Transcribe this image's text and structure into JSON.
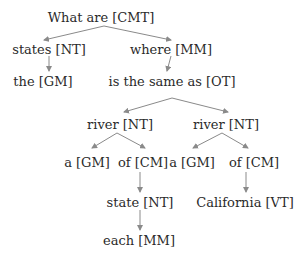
{
  "diagram": {
    "type": "dependency-tree",
    "edge_color": "#8a8a8a",
    "text_color": "#2a2a2a",
    "nodes": [
      {
        "id": "n0",
        "label": "What are [CMT]",
        "x": 101,
        "y": 17
      },
      {
        "id": "n1",
        "label": "states [NT]",
        "x": 49,
        "y": 49
      },
      {
        "id": "n2",
        "label": "where [MM]",
        "x": 171,
        "y": 49
      },
      {
        "id": "n3",
        "label": "the [GM]",
        "x": 43,
        "y": 81
      },
      {
        "id": "n4",
        "label": "is the same as [OT]",
        "x": 172,
        "y": 81
      },
      {
        "id": "n5",
        "label": "river [NT]",
        "x": 120,
        "y": 124
      },
      {
        "id": "n6",
        "label": "river [NT]",
        "x": 226,
        "y": 124
      },
      {
        "id": "n7",
        "label": "a [GM]",
        "x": 87,
        "y": 162
      },
      {
        "id": "n8",
        "label": "of [CM]",
        "x": 143,
        "y": 162
      },
      {
        "id": "n9",
        "label": "a [GM]",
        "x": 192,
        "y": 162
      },
      {
        "id": "n10",
        "label": "of [CM]",
        "x": 254,
        "y": 162
      },
      {
        "id": "n11",
        "label": "state [NT]",
        "x": 140,
        "y": 202
      },
      {
        "id": "n12",
        "label": "California [VT]",
        "x": 245,
        "y": 202
      },
      {
        "id": "n13",
        "label": "each [MM]",
        "x": 139,
        "y": 240
      }
    ],
    "edges": [
      {
        "from": "n0",
        "to": "n1",
        "x1": 104,
        "y1": 26,
        "x2": 44,
        "y2": 40
      },
      {
        "from": "n0",
        "to": "n2",
        "x1": 104,
        "y1": 26,
        "x2": 171,
        "y2": 40
      },
      {
        "from": "n1",
        "to": "n3",
        "x1": 49,
        "y1": 56,
        "x2": 49,
        "y2": 71
      },
      {
        "from": "n2",
        "to": "n4",
        "x1": 171,
        "y1": 56,
        "x2": 167,
        "y2": 71
      },
      {
        "from": "n4",
        "to": "n5",
        "x1": 172,
        "y1": 98,
        "x2": 124,
        "y2": 112
      },
      {
        "from": "n4",
        "to": "n6",
        "x1": 172,
        "y1": 98,
        "x2": 228,
        "y2": 112
      },
      {
        "from": "n5",
        "to": "n7",
        "x1": 117,
        "y1": 133,
        "x2": 92,
        "y2": 148
      },
      {
        "from": "n5",
        "to": "n8",
        "x1": 117,
        "y1": 133,
        "x2": 145,
        "y2": 148
      },
      {
        "from": "n6",
        "to": "n9",
        "x1": 222,
        "y1": 133,
        "x2": 193,
        "y2": 148
      },
      {
        "from": "n6",
        "to": "n10",
        "x1": 222,
        "y1": 133,
        "x2": 248,
        "y2": 148
      },
      {
        "from": "n8",
        "to": "n11",
        "x1": 140,
        "y1": 172,
        "x2": 140,
        "y2": 192
      },
      {
        "from": "n10",
        "to": "n12",
        "x1": 246,
        "y1": 172,
        "x2": 246,
        "y2": 192
      },
      {
        "from": "n11",
        "to": "n13",
        "x1": 140,
        "y1": 210,
        "x2": 140,
        "y2": 230
      }
    ]
  }
}
